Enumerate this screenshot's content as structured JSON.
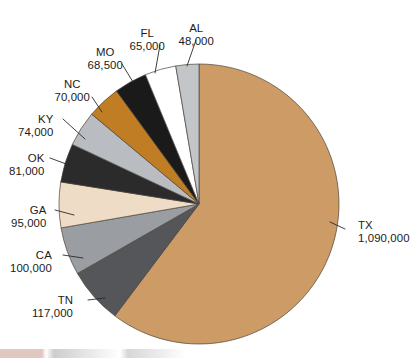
{
  "chart_data": {
    "type": "pie",
    "title": "",
    "subtitle": "",
    "xlabel": "",
    "ylabel": "",
    "legend_position": "none",
    "grid": false,
    "total": 1808500,
    "units": "head",
    "start_angle_deg": 0,
    "direction": "clockwise",
    "categories": [
      "TX",
      "TN",
      "CA",
      "GA",
      "OK",
      "KY",
      "NC",
      "MO",
      "FL",
      "AL"
    ],
    "values": [
      1090000,
      117000,
      100000,
      95000,
      81000,
      74000,
      70000,
      68500,
      65000,
      48000
    ],
    "value_labels": [
      "1,090,000",
      "117,000",
      "100,000",
      "95,000",
      "81,000",
      "74,000",
      "70,000",
      "68,500",
      "65,000",
      "48,000"
    ],
    "colors": [
      "#cd9b66",
      "#55565a",
      "#9a9da1",
      "#efdcc6",
      "#2b2b2b",
      "#b9bcc0",
      "#c07d23",
      "#1a1a1a",
      "#ffffff",
      "#c3c6c9"
    ],
    "slices": [
      {
        "name": "TX",
        "label": "TX",
        "value": 1090000,
        "value_label": "1,090,000",
        "color": "#cd9b66",
        "label_x": 358,
        "label_y": 219,
        "align": "left",
        "leader": {
          "x1": 345,
          "y1": 229,
          "x2": 330,
          "y2": 222
        }
      },
      {
        "name": "TN",
        "label": "TN",
        "value": 117000,
        "value_label": "117,000",
        "color": "#55565a",
        "label_x": 73,
        "label_y": 294,
        "align": "right",
        "leader": {
          "x1": 88,
          "y1": 300,
          "x2": 105,
          "y2": 298
        }
      },
      {
        "name": "CA",
        "label": "CA",
        "value": 100000,
        "value_label": "100,000",
        "color": "#9a9da1",
        "label_x": 52,
        "label_y": 249,
        "align": "right",
        "leader": {
          "x1": 63,
          "y1": 255,
          "x2": 83,
          "y2": 258
        }
      },
      {
        "name": "GA",
        "label": "GA",
        "value": 95000,
        "value_label": "95,000",
        "color": "#efdcc6",
        "label_x": 46,
        "label_y": 204,
        "align": "right",
        "leader": {
          "x1": 55,
          "y1": 210,
          "x2": 74,
          "y2": 215
        }
      },
      {
        "name": "OK",
        "label": "OK",
        "value": 81000,
        "value_label": "81,000",
        "color": "#2b2b2b",
        "label_x": 44,
        "label_y": 152,
        "align": "right",
        "leader": {
          "x1": 50,
          "y1": 158,
          "x2": 77,
          "y2": 168
        }
      },
      {
        "name": "KY",
        "label": "KY",
        "value": 74000,
        "value_label": "74,000",
        "color": "#b9bcc0",
        "label_x": 53,
        "label_y": 113,
        "align": "right",
        "leader": {
          "x1": 63,
          "y1": 119,
          "x2": 85,
          "y2": 139
        }
      },
      {
        "name": "NC",
        "label": "NC",
        "value": 70000,
        "value_label": "70,000",
        "color": "#c07d23",
        "label_x": 72,
        "label_y": 78,
        "align": "center",
        "leader": {
          "x1": 92,
          "y1": 97,
          "x2": 102,
          "y2": 112
        }
      },
      {
        "name": "MO",
        "label": "MO",
        "value": 68500,
        "value_label": "68,500",
        "color": "#1a1a1a",
        "label_x": 105,
        "label_y": 46,
        "align": "center",
        "leader": {
          "x1": 122,
          "y1": 64,
          "x2": 133,
          "y2": 82
        }
      },
      {
        "name": "FL",
        "label": "FL",
        "value": 65000,
        "value_label": "65,000",
        "color": "#ffffff",
        "label_x": 147,
        "label_y": 27,
        "align": "center",
        "leader": {
          "x1": 160,
          "y1": 45,
          "x2": 155,
          "y2": 73
        }
      },
      {
        "name": "AL",
        "label": "AL",
        "value": 48000,
        "value_label": "48,000",
        "color": "#c3c6c9",
        "label_x": 196,
        "label_y": 22,
        "align": "center",
        "leader": {
          "x1": 196,
          "y1": 40,
          "x2": 187,
          "y2": 66
        }
      }
    ],
    "geometry": {
      "cx": 199,
      "cy": 204,
      "r": 140
    }
  }
}
